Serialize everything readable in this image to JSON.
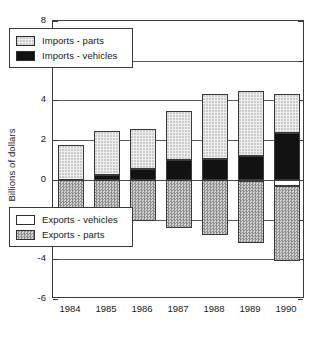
{
  "chart_data": {
    "type": "bar",
    "title": "",
    "subtitle": "",
    "xlabel": "",
    "ylabel": "Billions of dollars",
    "categories": [
      "1984",
      "1985",
      "1986",
      "1987",
      "1988",
      "1989",
      "1990"
    ],
    "ylim": [
      -6,
      8
    ],
    "yticks": [
      8,
      6,
      4,
      2,
      0,
      -2,
      -4,
      -6
    ],
    "ytick_labels": [
      "8",
      "6",
      "4",
      "2",
      "0",
      "-2",
      "-4",
      "-6"
    ],
    "grid": true,
    "stacked": true,
    "legend_position": "inside-upper-left and inside-lower-left",
    "series": [
      {
        "name": "Imports - parts",
        "color": "#ededed",
        "pattern": "fine-dotted",
        "values": [
          1.75,
          2.2,
          2.0,
          2.45,
          3.25,
          3.3,
          1.95
        ]
      },
      {
        "name": "Imports - vehicles",
        "color": "#121212",
        "pattern": "solid-black",
        "values": [
          0.0,
          0.25,
          0.55,
          1.0,
          1.05,
          1.2,
          2.35
        ]
      },
      {
        "name": "Exports - vehicles",
        "color": "#ffffff",
        "pattern": "white",
        "values": [
          0.0,
          0.0,
          0.0,
          0.0,
          0.0,
          -0.05,
          -0.3
        ]
      },
      {
        "name": "Exports - parts",
        "color": "#b9b9b9",
        "pattern": "coarse-checker",
        "values": [
          -1.4,
          -1.85,
          -2.05,
          -2.45,
          -2.8,
          -3.15,
          -3.8
        ]
      }
    ],
    "stack_totals_positive": [
      1.75,
      2.45,
      2.55,
      3.45,
      4.3,
      4.5,
      4.3
    ],
    "stack_totals_negative": [
      -1.4,
      -1.85,
      -2.05,
      -2.45,
      -2.8,
      -3.2,
      -4.1
    ]
  },
  "legends": {
    "imports": [
      {
        "label": "Imports - parts",
        "swatch": "imp-parts"
      },
      {
        "label": "Imports - vehicles",
        "swatch": "imp-veh"
      }
    ],
    "exports": [
      {
        "label": "Exports - vehicles",
        "swatch": "exp-veh"
      },
      {
        "label": "Exports - parts",
        "swatch": "exp-parts"
      }
    ]
  }
}
